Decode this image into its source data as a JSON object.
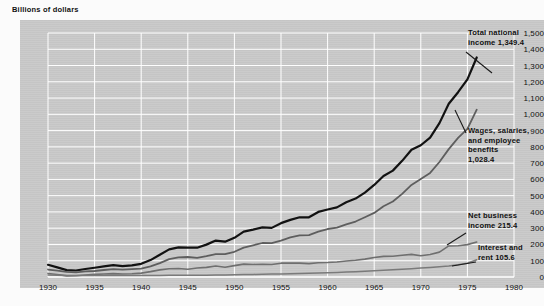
{
  "header": {
    "units_label": "Billions of dollars"
  },
  "chart_data": {
    "type": "line",
    "title": "",
    "subtitle": "",
    "xlabel": "",
    "ylabel": "Billions of dollars",
    "xlim": [
      1930,
      1980
    ],
    "ylim": [
      0,
      1500
    ],
    "grid": true,
    "legend_position": "right-inline-annotations",
    "xticks": [
      1930,
      1935,
      1940,
      1945,
      1950,
      1955,
      1960,
      1965,
      1970,
      1975,
      1980
    ],
    "xtick_labels": [
      "1930",
      "1935",
      "1940",
      "1945",
      "1950",
      "1955",
      "1960",
      "1965",
      "1970",
      "1975",
      "1980"
    ],
    "yticks": [
      0,
      100,
      200,
      300,
      400,
      500,
      600,
      700,
      800,
      900,
      1000,
      1100,
      1200,
      1300,
      1400,
      1500
    ],
    "ytick_labels": [
      "0",
      "100",
      "200",
      "300",
      "400",
      "500",
      "600",
      "700",
      "800",
      "900",
      "1,000",
      "1,100",
      "1,200",
      "1,300",
      "1,400",
      "1,500"
    ],
    "x": [
      1930,
      1931,
      1932,
      1933,
      1934,
      1935,
      1936,
      1937,
      1938,
      1939,
      1940,
      1941,
      1942,
      1943,
      1944,
      1945,
      1946,
      1947,
      1948,
      1949,
      1950,
      1951,
      1952,
      1953,
      1954,
      1955,
      1956,
      1957,
      1958,
      1959,
      1960,
      1961,
      1962,
      1963,
      1964,
      1965,
      1966,
      1967,
      1968,
      1969,
      1970,
      1971,
      1972,
      1973,
      1974,
      1975,
      1976
    ],
    "series": [
      {
        "name": "Total national income",
        "end_value": 1349.4,
        "end_label": "1,349.4",
        "color": "#121212",
        "width": 2.2,
        "values": [
          75,
          59,
          42,
          40,
          49,
          57,
          65,
          73,
          67,
          72,
          81,
          104,
          137,
          170,
          182,
          181,
          180,
          199,
          224,
          217,
          241,
          279,
          291,
          305,
          302,
          331,
          351,
          367,
          367,
          400,
          415,
          428,
          460,
          482,
          519,
          566,
          621,
          654,
          714,
          782,
          810,
          857,
          946,
          1065,
          1136,
          1215,
          1349.4
        ]
      },
      {
        "name": "Wages, salaries, and employee benefits",
        "end_value": 1028.4,
        "end_label": "1,028.4",
        "color": "#5e5e5e",
        "width": 1.8,
        "values": [
          46,
          39,
          31,
          29,
          34,
          37,
          43,
          48,
          45,
          48,
          52,
          65,
          85,
          110,
          121,
          123,
          118,
          128,
          141,
          141,
          155,
          181,
          195,
          209,
          208,
          224,
          243,
          256,
          258,
          279,
          295,
          303,
          323,
          341,
          367,
          394,
          435,
          464,
          511,
          566,
          603,
          640,
          707,
          786,
          855,
          911,
          1028.4
        ]
      },
      {
        "name": "Net business income",
        "end_value": 215.4,
        "end_label": "215.4",
        "color": "#6f6f6f",
        "width": 1.6,
        "values": [
          22,
          15,
          7,
          8,
          12,
          16,
          18,
          21,
          18,
          20,
          24,
          33,
          44,
          51,
          52,
          48,
          55,
          59,
          68,
          60,
          70,
          79,
          77,
          78,
          77,
          85,
          86,
          85,
          82,
          88,
          89,
          92,
          98,
          103,
          110,
          120,
          127,
          128,
          134,
          139,
          131,
          138,
          153,
          191,
          192,
          199,
          215.4
        ]
      },
      {
        "name": "Interest and rent",
        "end_value": 105.6,
        "end_label": "105.6",
        "color": "#7a7a7a",
        "width": 1.5,
        "values": [
          12,
          11,
          9,
          9,
          9,
          9,
          9,
          9,
          9,
          9,
          9,
          9,
          9,
          10,
          10,
          10,
          11,
          11,
          12,
          13,
          14,
          15,
          16,
          17,
          18,
          19,
          20,
          22,
          23,
          24,
          26,
          28,
          30,
          33,
          35,
          38,
          41,
          44,
          47,
          51,
          55,
          59,
          63,
          68,
          75,
          85,
          105.6
        ]
      }
    ],
    "annotations": [
      {
        "id": "total-national-income",
        "lines": [
          "Total national",
          "income  1,349.4"
        ],
        "x": 468,
        "y": 28,
        "leader": {
          "x1": 466,
          "y1": 52,
          "x2": 492,
          "y2": 73
        }
      },
      {
        "id": "wages-salaries-benefits",
        "lines": [
          "Wages, salaries,",
          "and employee",
          "benefits",
          "1,028.4"
        ],
        "x": 468,
        "y": 126,
        "leader": {
          "x1": 466,
          "y1": 133,
          "x2": 455,
          "y2": 110
        }
      },
      {
        "id": "net-business-income",
        "lines": [
          "Net business",
          "income  215.4"
        ],
        "x": 468,
        "y": 211,
        "leader": {
          "x1": 466,
          "y1": 233,
          "x2": 447,
          "y2": 245
        }
      },
      {
        "id": "interest-and-rent",
        "lines": [
          "Interest and",
          "rent  105.6"
        ],
        "x": 478,
        "y": 243,
        "leader": {
          "x1": 476,
          "y1": 262,
          "x2": 452,
          "y2": 266
        }
      }
    ]
  }
}
